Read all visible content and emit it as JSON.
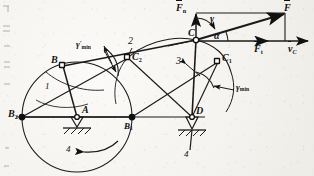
{
  "figure": {
    "type": "kinematic-linkage-diagram",
    "ink_color": "#111111",
    "paper_color": "#f4f3ef"
  },
  "points": {
    "A": {
      "label": "A",
      "x": 77,
      "y": 117,
      "kind": "fixed-pivot"
    },
    "D": {
      "label": "D",
      "x": 192,
      "y": 117,
      "kind": "fixed-pivot"
    },
    "B": {
      "label": "B",
      "x": 63,
      "y": 66,
      "kind": "moving-joint"
    },
    "B1": {
      "label": "B",
      "sub": "1",
      "x": 132,
      "y": 117,
      "kind": "moving-joint"
    },
    "B2": {
      "label": "B",
      "sub": "2",
      "x": 22,
      "y": 117,
      "kind": "moving-joint"
    },
    "C": {
      "label": "C",
      "x": 196,
      "y": 40,
      "kind": "moving-joint"
    },
    "C1": {
      "label": "C",
      "sub": "1",
      "x": 218,
      "y": 62,
      "kind": "moving-joint"
    },
    "C2": {
      "label": "C",
      "sub": "2",
      "x": 128,
      "y": 58,
      "kind": "moving-joint"
    },
    "F": {
      "label": "F",
      "x": 285,
      "y": 12,
      "kind": "vector-tip"
    }
  },
  "links": [
    {
      "id": "1",
      "label": "1",
      "x": 47,
      "y": 88,
      "desc": "crank A-B"
    },
    {
      "id": "2",
      "label": "2",
      "x": 131,
      "y": 42,
      "desc": "coupler B-C"
    },
    {
      "id": "3",
      "label": "3",
      "x": 179,
      "y": 62,
      "desc": "rocker C-D"
    },
    {
      "id": "4a",
      "label": "4",
      "x": 68,
      "y": 152,
      "desc": "frame at A"
    },
    {
      "id": "4b",
      "label": "4",
      "x": 185,
      "y": 157,
      "desc": "frame at D"
    }
  ],
  "vectors": [
    {
      "name": "F",
      "label": "F",
      "x": 286,
      "y": 10,
      "desc": "resultant force at C"
    },
    {
      "name": "Fn",
      "label": "F",
      "sub": "n",
      "x": 179,
      "y": 9,
      "desc": "normal force component"
    },
    {
      "name": "Ft",
      "label": "F",
      "sub": "t",
      "x": 258,
      "y": 47,
      "desc": "tangential force component"
    },
    {
      "name": "vC",
      "label": "v",
      "sub": "C",
      "x": 292,
      "y": 45,
      "desc": "velocity of point C"
    }
  ],
  "angles": [
    {
      "name": "gamma",
      "label": "γ",
      "x": 212,
      "y": 20,
      "desc": "transmission angle at C"
    },
    {
      "name": "alpha",
      "label": "α",
      "x": 215,
      "y": 36,
      "desc": "pressure angle at C"
    },
    {
      "name": "gamma_min",
      "label": "γ",
      "sub": "min",
      "x": 238,
      "y": 88,
      "desc": "minimum transmission angle at C1"
    },
    {
      "name": "gamma_min_prime",
      "label": "γ",
      "prime": "′",
      "sub": "min",
      "x": 82,
      "y": 45,
      "desc": "minimum transmission angle at C2"
    }
  ],
  "circle": {
    "center": {
      "x": 77,
      "y": 117
    },
    "radius": 55,
    "desc": "crank circle traced by B"
  },
  "rotation_arrow": {
    "x": 95,
    "y": 150,
    "desc": "crank rotation direction"
  }
}
